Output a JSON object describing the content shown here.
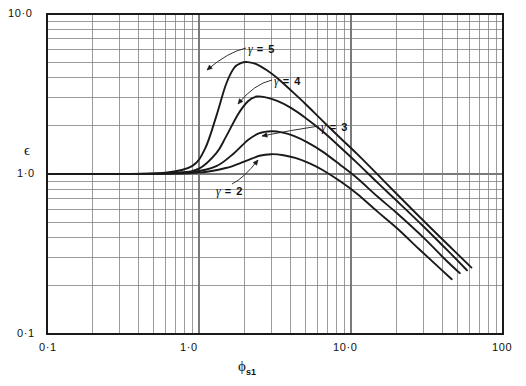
{
  "figure": {
    "background": "#ffffff",
    "ink": "#1a1a1a",
    "gridcolor": "#7a7a7a"
  },
  "labels": {
    "y_axis_title": "ϵ",
    "x_axis_title_symbol": "ϕ",
    "x_axis_title_sub": "s1",
    "y_top": "10·0",
    "y_mid": "1·0",
    "y_bottom": "0·1",
    "x_left": "0·1",
    "x_mid": "1·0",
    "x_dec2": "10·0",
    "x_right": "100"
  },
  "curve_labels": [
    {
      "name": "gamma-5",
      "symbol": "γ",
      "eq": "= 5",
      "x": 248,
      "y": 42
    },
    {
      "name": "gamma-4",
      "symbol": "γ",
      "eq": "= 4",
      "x": 274,
      "y": 74
    },
    {
      "name": "gamma-3",
      "symbol": "γ",
      "eq": "= 3",
      "x": 321,
      "y": 120
    },
    {
      "name": "gamma-2",
      "symbol": "γ",
      "eq": "= 2",
      "x": 216,
      "y": 184
    }
  ],
  "chart_data": {
    "type": "line",
    "title": "",
    "xlabel": "ϕ_s1",
    "ylabel": "ϵ",
    "xscale": "log",
    "yscale": "log",
    "xlim": [
      0.1,
      100
    ],
    "ylim": [
      0.1,
      10.0
    ],
    "grid": "log-minor-both-axes",
    "legend": "inline-annotations-with-leader-lines",
    "series": [
      {
        "name": "γ = 5",
        "x": [
          0.1,
          0.3,
          0.6,
          0.9,
          1.1,
          1.3,
          1.5,
          1.7,
          1.9,
          2.1,
          2.4,
          2.8,
          3.3,
          4.0,
          5.0,
          6.5,
          8.5,
          11.0,
          15.0,
          20.0,
          30.0,
          45.0,
          62.0
        ],
        "y": [
          1.0,
          1.0,
          1.02,
          1.12,
          1.45,
          2.3,
          3.6,
          4.6,
          4.95,
          5.0,
          4.85,
          4.45,
          3.95,
          3.35,
          2.75,
          2.15,
          1.68,
          1.33,
          0.99,
          0.75,
          0.51,
          0.35,
          0.26
        ]
      },
      {
        "name": "γ = 4",
        "x": [
          0.1,
          0.3,
          0.7,
          1.0,
          1.3,
          1.5,
          1.8,
          2.1,
          2.4,
          2.8,
          3.3,
          4.0,
          5.0,
          6.5,
          8.5,
          11.0,
          15.0,
          20.0,
          30.0,
          45.0,
          58.0
        ],
        "y": [
          1.0,
          1.0,
          1.02,
          1.08,
          1.35,
          1.7,
          2.35,
          2.85,
          3.05,
          3.0,
          2.85,
          2.6,
          2.25,
          1.85,
          1.47,
          1.17,
          0.88,
          0.68,
          0.47,
          0.32,
          0.25
        ]
      },
      {
        "name": "γ = 3",
        "x": [
          0.1,
          0.4,
          0.9,
          1.3,
          1.7,
          2.1,
          2.5,
          3.0,
          3.5,
          4.2,
          5.2,
          6.5,
          8.5,
          11.0,
          15.0,
          20.0,
          30.0,
          42.0,
          52.0
        ],
        "y": [
          1.0,
          1.0,
          1.03,
          1.12,
          1.35,
          1.63,
          1.8,
          1.85,
          1.82,
          1.73,
          1.57,
          1.38,
          1.14,
          0.94,
          0.72,
          0.57,
          0.4,
          0.29,
          0.24
        ]
      },
      {
        "name": "γ = 2",
        "x": [
          0.1,
          0.5,
          1.0,
          1.5,
          2.0,
          2.5,
          3.0,
          3.6,
          4.3,
          5.3,
          6.5,
          8.5,
          11.0,
          15.0,
          20.0,
          28.0,
          38.0,
          46.0
        ],
        "y": [
          1.0,
          1.0,
          1.02,
          1.09,
          1.2,
          1.3,
          1.33,
          1.31,
          1.26,
          1.17,
          1.06,
          0.9,
          0.75,
          0.58,
          0.46,
          0.34,
          0.26,
          0.22
        ]
      }
    ]
  }
}
